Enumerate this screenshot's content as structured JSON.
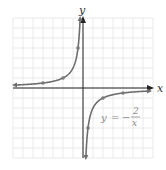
{
  "chart_data": {
    "type": "line",
    "title": "",
    "equation_label": {
      "lhs": "y",
      "equals": "=",
      "sign": "−",
      "numerator": "2",
      "denominator": "x"
    },
    "xlabel": "x",
    "ylabel": "y",
    "xlim": [
      -7,
      7
    ],
    "ylim": [
      -7,
      7
    ],
    "grid": true,
    "function": "y = -2/x",
    "series": [
      {
        "name": "y = -2/x (x<0)",
        "points": [
          [
            -6.8,
            0.29
          ],
          [
            -4,
            0.5
          ],
          [
            -2,
            1
          ],
          [
            -0.5,
            4
          ],
          [
            -0.3,
            6.7
          ]
        ]
      },
      {
        "name": "y = -2/x (x>0)",
        "points": [
          [
            0.3,
            -6.7
          ],
          [
            0.5,
            -4
          ],
          [
            2,
            -1
          ],
          [
            4,
            -0.5
          ],
          [
            6.5,
            -0.31
          ]
        ]
      }
    ],
    "marked_points": [
      [
        -4,
        0.5
      ],
      [
        -2,
        1
      ],
      [
        -0.5,
        4
      ],
      [
        0.5,
        -4
      ],
      [
        2,
        -1
      ],
      [
        4,
        -0.5
      ]
    ],
    "colors": {
      "curve": "#6e6e6e",
      "grid": "#e4e4e4",
      "axis": "#222222",
      "point": "#7a7a7a"
    }
  }
}
